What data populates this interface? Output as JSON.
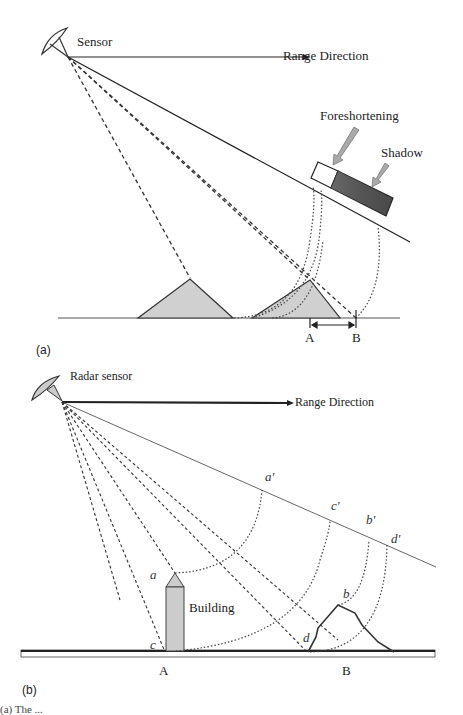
{
  "figure_a": {
    "panel_label": "(a)",
    "sensor_label": "Sensor",
    "range_direction_label": "Range Direction",
    "foreshortening_label": "Foreshortening",
    "shadow_label": "Shadow",
    "point_a_label": "A",
    "point_b_label": "B",
    "colors": {
      "mountain_fill": "#d0d0d0",
      "shadow_fill": "#555555",
      "foreshortening_fill": "#ffffff",
      "arrow_fill": "#aaaaaa",
      "line": "#222222"
    }
  },
  "figure_b": {
    "panel_label": "(b)",
    "sensor_label": "Radar sensor",
    "range_direction_label": "Range Direction",
    "building_label": "Building",
    "point_labels": {
      "a": "a",
      "c": "c",
      "b": "b",
      "d": "d",
      "a_prime": "a'",
      "c_prime": "c'",
      "b_prime": "b'",
      "d_prime": "d'"
    },
    "ground_a_label": "A",
    "ground_b_label": "B",
    "colors": {
      "building_fill": "#cccccc",
      "line": "#222222"
    }
  },
  "caption": "(a) The ..."
}
